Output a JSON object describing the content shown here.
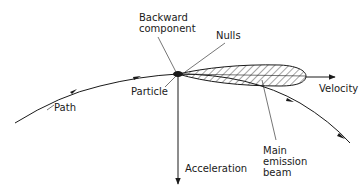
{
  "diagram": {
    "labels": {
      "backward_component_line1": "Backward",
      "backward_component_line2": "component",
      "nulls": "Nulls",
      "particle": "Particle",
      "path": "Path",
      "velocity": "Velocity",
      "acceleration": "Acceleration",
      "main_beam_line1": "Main",
      "main_beam_line2": "emission",
      "main_beam_line3": "beam"
    },
    "colors": {
      "ink": "#1a1a1a",
      "background": "#ffffff"
    }
  }
}
